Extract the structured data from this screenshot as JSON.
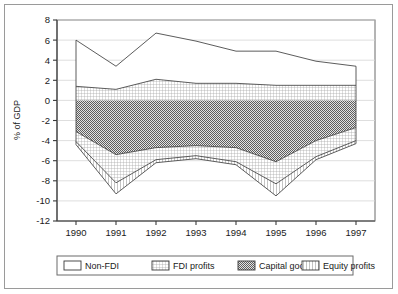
{
  "chart_data": {
    "type": "area",
    "stacked": true,
    "title": "",
    "subtitle": "",
    "xlabel": "",
    "ylabel": "% of GDP",
    "categories": [
      "1990",
      "1991",
      "1992",
      "1993",
      "1994",
      "1995",
      "1996",
      "1997"
    ],
    "x": [
      1990,
      1991,
      1992,
      1993,
      1994,
      1995,
      1996,
      1997
    ],
    "ylim": [
      -12,
      8
    ],
    "yticks": [
      8,
      6,
      4,
      2,
      0,
      -2,
      -4,
      -6,
      -8,
      -10,
      -12
    ],
    "ytick_labels": [
      "8",
      "6",
      "4",
      "2",
      "0",
      "-2",
      "-4",
      "-6",
      "-8",
      "-10",
      "-12"
    ],
    "grid": true,
    "legend_position": "bottom",
    "series": [
      {
        "name": "Non-FDI",
        "pattern": "none",
        "color": "#ffffff",
        "values": [
          4.6,
          2.3,
          4.6,
          4.2,
          3.2,
          3.4,
          2.4,
          1.9
        ]
      },
      {
        "name": "FDI profits",
        "pattern": "fine-grid",
        "color": "#c9c9c9",
        "values": [
          1.4,
          1.1,
          2.1,
          1.7,
          1.7,
          1.5,
          1.5,
          1.5
        ]
      },
      {
        "name": "Capital goods",
        "pattern": "dense-dark",
        "color": "#7d7d7d",
        "values": [
          -3.1,
          -5.4,
          -4.7,
          -4.5,
          -4.7,
          -6.1,
          -4.0,
          -2.7
        ]
      },
      {
        "name": "Equity profits",
        "pattern": "vertical-lines",
        "color": "#d8d8d8",
        "values": [
          -1.0,
          -2.8,
          -1.2,
          -1.0,
          -1.4,
          -2.2,
          -1.6,
          -1.3
        ]
      }
    ],
    "stack_boundaries": {
      "note": "cumulative band edges per year, top-of-stack down to bottom-of-stack",
      "top_non_fdi": [
        6.0,
        3.4,
        6.7,
        5.9,
        4.9,
        4.9,
        3.9,
        3.4
      ],
      "top_fdi_profits": [
        1.4,
        1.1,
        2.1,
        1.7,
        1.7,
        1.5,
        1.5,
        1.5
      ],
      "zero_baseline": [
        0,
        0,
        0,
        0,
        0,
        0,
        0,
        0
      ],
      "bottom_capital_goods": [
        -3.1,
        -5.4,
        -4.7,
        -4.5,
        -4.7,
        -6.1,
        -4.0,
        -2.7
      ],
      "bottom_equity_profits": [
        -4.1,
        -8.2,
        -5.9,
        -5.5,
        -6.1,
        -8.3,
        -5.6,
        -4.0
      ],
      "bottom_outline": [
        -4.4,
        -9.3,
        -6.2,
        -5.8,
        -6.4,
        -9.5,
        -5.9,
        -4.3
      ]
    }
  },
  "axis": {
    "y_title": "% of GDP"
  },
  "legend": {
    "items": [
      {
        "label": "Non-FDI",
        "swatch": "none"
      },
      {
        "label": "FDI profits",
        "swatch": "fine-grid"
      },
      {
        "label": "Capital goods",
        "swatch": "dense-dark"
      },
      {
        "label": "Equity profits",
        "swatch": "vertical-lines"
      }
    ]
  }
}
